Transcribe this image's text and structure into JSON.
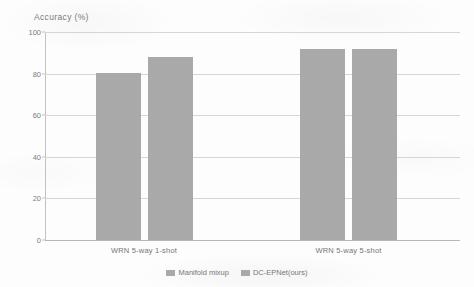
{
  "chart_data": {
    "type": "bar",
    "title": "",
    "ylabel": "Accuracy  (%)",
    "xlabel": "",
    "categories": [
      "WRN 5-way 1-shot",
      "WRN 5-way 5-shot"
    ],
    "series": [
      {
        "name": "Manifold mixup",
        "values": [
          80.5,
          91.7
        ],
        "color": "#a9a9a9"
      },
      {
        "name": "DC-EPNet(ours)",
        "values": [
          87.9,
          91.6
        ],
        "color": "#a9a9a9"
      }
    ],
    "ylim": [
      0,
      100
    ],
    "yticks": [
      0,
      20,
      40,
      60,
      80,
      100
    ],
    "ytick_labels": [
      "0",
      "20",
      "40",
      "60",
      "80",
      "100"
    ],
    "grid": true,
    "legend_position": "bottom"
  },
  "legend": {
    "items": [
      {
        "label": "Manifold mixup"
      },
      {
        "label": "DC-EPNet(ours)"
      }
    ]
  }
}
